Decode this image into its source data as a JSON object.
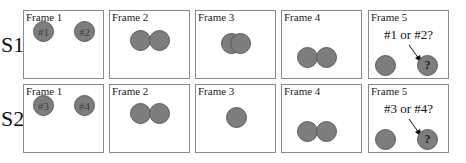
{
  "rows": [
    {
      "label": "S1",
      "frames": [
        {
          "title": "Frame 1",
          "ball_labels": [
            "#1",
            "#2"
          ]
        },
        {
          "title": "Frame 2"
        },
        {
          "title": "Frame 3"
        },
        {
          "title": "Frame 4"
        },
        {
          "title": "Frame 5",
          "question": "#1 or #2?",
          "unknown_label": "?"
        }
      ]
    },
    {
      "label": "S2",
      "frames": [
        {
          "title": "Frame 1",
          "ball_labels": [
            "#3",
            "#4"
          ]
        },
        {
          "title": "Frame 2"
        },
        {
          "title": "Frame 3"
        },
        {
          "title": "Frame 4"
        },
        {
          "title": "Frame 5",
          "question": "#3 or #4?",
          "unknown_label": "?"
        }
      ]
    }
  ],
  "colors": {
    "ball_fill": "#7d7d7d",
    "ball_stroke": "#5c5c5c",
    "frame_border": "#8a8a8a"
  }
}
